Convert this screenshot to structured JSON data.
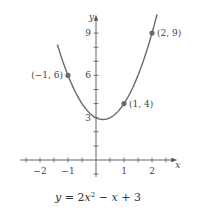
{
  "chart_data": {
    "type": "line",
    "title": "",
    "caption": "y = 2x² − x + 3",
    "caption_parts": {
      "y": "y",
      "eq": " = 2",
      "x1": "x",
      "sup": "2",
      "minus": " − ",
      "x2": "x",
      "plus": " + 3"
    },
    "xlabel": "x",
    "ylabel": "y",
    "xlim": [
      -2.7,
      2.9
    ],
    "ylim": [
      -1.2,
      10.3
    ],
    "x_tick_step": 0.5,
    "y_tick_step": 1,
    "x_tick_labels": [
      {
        "value": -2,
        "label": "−2"
      },
      {
        "value": -1,
        "label": "−1"
      },
      {
        "value": 1,
        "label": "1"
      },
      {
        "value": 2,
        "label": "2"
      }
    ],
    "y_tick_labels": [
      {
        "value": 3,
        "label": "3"
      },
      {
        "value": 6,
        "label": "6"
      },
      {
        "value": 9,
        "label": "9"
      }
    ],
    "function": {
      "a": 2,
      "b": -1,
      "c": 3,
      "x_range": [
        -1.38,
        2.18
      ]
    },
    "points": [
      {
        "x": -1,
        "y": 6,
        "label": "(−1, 6)",
        "label_side": "left"
      },
      {
        "x": 1,
        "y": 4,
        "label": "(1, 4)",
        "label_side": "right"
      },
      {
        "x": 2,
        "y": 9,
        "label": "(2, 9)",
        "label_side": "right"
      }
    ],
    "colors": {
      "curve": "#6b6b6b",
      "axis": "#555555",
      "point": "#6b6b6b"
    },
    "grid": false,
    "legend": "none"
  }
}
